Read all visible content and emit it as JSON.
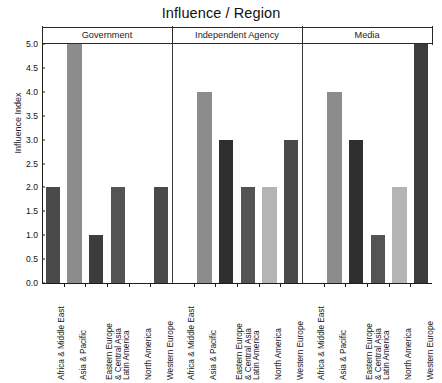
{
  "chart_data": {
    "type": "bar",
    "title": "Influence / Region",
    "xlabel": "",
    "ylabel": "Influence Index",
    "ylim": [
      0.0,
      5.0
    ],
    "yticks": [
      "0.0",
      "0.5",
      "1.0",
      "1.5",
      "2.0",
      "2.5",
      "3.0",
      "3.5",
      "4.0",
      "4.5",
      "5.0"
    ],
    "grid": false,
    "legend": "none",
    "panels": [
      "Government",
      "Independent Agency",
      "Media"
    ],
    "categories": [
      "Africa & Middle East",
      "Asia & Pacific",
      "Eastern Europe & Central Asia",
      "Latin America",
      "North America",
      "Western Europe"
    ],
    "category_lines": [
      [
        "Africa & Middle East"
      ],
      [
        "Asia & Pacific"
      ],
      [
        "Eastern Europe",
        "& Central Asia"
      ],
      [
        "Latin America"
      ],
      [
        "North America"
      ],
      [
        "Western Europe"
      ]
    ],
    "series": [
      {
        "name": "Government",
        "values": [
          2.0,
          5.0,
          1.0,
          2.0,
          0.0,
          2.0
        ]
      },
      {
        "name": "Independent Agency",
        "values": [
          0.0,
          4.0,
          3.0,
          2.0,
          2.0,
          3.0
        ]
      },
      {
        "name": "Media",
        "values": [
          0.0,
          4.0,
          3.0,
          1.0,
          2.0,
          5.0
        ]
      }
    ],
    "bar_colors": [
      [
        "#4a4a4a",
        "#8c8c8c",
        "#3c3c3c",
        "#545454",
        "#b4b4b4",
        "#4a4a4a"
      ],
      [
        "#4a4a4a",
        "#8c8c8c",
        "#2f2f2f",
        "#545454",
        "#b4b4b4",
        "#4a4a4a"
      ],
      [
        "#4a4a4a",
        "#8c8c8c",
        "#2f2f2f",
        "#545454",
        "#b4b4b4",
        "#3c3c3c"
      ]
    ],
    "colors": {
      "axis": "#1c1c1c",
      "text": "#161616",
      "background": "#ffffff",
      "bar_dark": "#3c3c3c",
      "bar_medium": "#8c8c8c",
      "bar_light": "#b4b4b4"
    }
  }
}
